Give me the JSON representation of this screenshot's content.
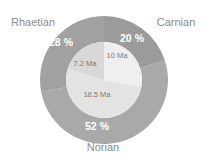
{
  "chart_data": {
    "type": "pie",
    "title": "",
    "outer": {
      "series_name": "Stage share",
      "slices": [
        {
          "label": "Carnian",
          "percent": 20,
          "value_label": "20 %",
          "color": "#9b9b9b"
        },
        {
          "label": "Norian",
          "percent": 52,
          "value_label": "52 %",
          "color": "#a9a9a9"
        },
        {
          "label": "Rhaetian",
          "percent": 28,
          "value_label": "28 %",
          "color": "#a1a1a1"
        }
      ]
    },
    "inner": {
      "series_name": "Duration",
      "slices": [
        {
          "stage": "Carnian",
          "value": 10,
          "value_label": "10 Ma",
          "color": "#efefef"
        },
        {
          "stage": "Norian",
          "value": 18.5,
          "value_label": "18.5 Ma",
          "color": "#e3e3e3"
        },
        {
          "stage": "Rhaetian",
          "value": 7.2,
          "value_label": "7.2 Ma",
          "color": "#d8d8d8"
        }
      ]
    },
    "legend": "none"
  }
}
